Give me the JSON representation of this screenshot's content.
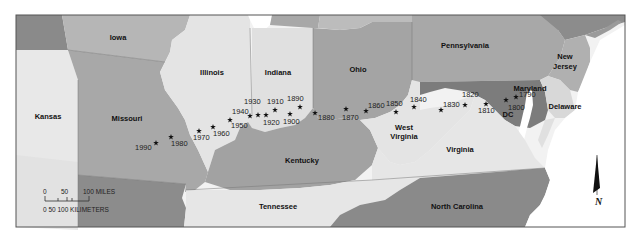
{
  "map": {
    "title": "Mean center of U.S. population, 1790–1990",
    "frame": {
      "x": 16,
      "y": 15,
      "w": 609,
      "h": 212
    },
    "colors": {
      "frame": "#555555",
      "water": "#ffffff",
      "light": "#e6e6e6",
      "mid": "#b4b4b4",
      "dark": "#8c8c8c",
      "darker": "#6e6e6e",
      "maryland": "#7a7a7a"
    },
    "states": [
      {
        "name": "Iowa",
        "label_x": 118,
        "label_y": 40
      },
      {
        "name": "Illinois",
        "label_x": 212,
        "label_y": 75
      },
      {
        "name": "Indiana",
        "label_x": 278,
        "label_y": 75
      },
      {
        "name": "Ohio",
        "label_x": 358,
        "label_y": 72
      },
      {
        "name": "Pennsylvania",
        "label_x": 465,
        "label_y": 48
      },
      {
        "name": "New",
        "label_x": 565,
        "label_y": 59
      },
      {
        "name": "Jersey",
        "label_x": 565,
        "label_y": 69
      },
      {
        "name": "Kansas",
        "label_x": 48,
        "label_y": 119
      },
      {
        "name": "Missouri",
        "label_x": 127,
        "label_y": 121
      },
      {
        "name": "Maryland",
        "label_x": 530,
        "label_y": 91
      },
      {
        "name": "Delaware",
        "label_x": 565,
        "label_y": 109
      },
      {
        "name": "DC",
        "label_x": 508,
        "label_y": 117
      },
      {
        "name": "West",
        "label_x": 404,
        "label_y": 130
      },
      {
        "name": "Virginia",
        "label_x": 404,
        "label_y": 139
      },
      {
        "name": "Virginia",
        "label_x": 460,
        "label_y": 152
      },
      {
        "name": "Kentucky",
        "label_x": 302,
        "label_y": 163
      },
      {
        "name": "Tennessee",
        "label_x": 278,
        "label_y": 209
      },
      {
        "name": "North Carolina",
        "label_x": 457,
        "label_y": 209
      }
    ],
    "population_centers": [
      {
        "year": "1790",
        "x": 516,
        "y": 97,
        "lx": 519,
        "ly": 97
      },
      {
        "year": "1800",
        "x": 506,
        "y": 100,
        "lx": 508,
        "ly": 110
      },
      {
        "year": "1810",
        "x": 486,
        "y": 104,
        "lx": 478,
        "ly": 113
      },
      {
        "year": "1820",
        "x": 465,
        "y": 105,
        "lx": 462,
        "ly": 97
      },
      {
        "year": "1830",
        "x": 441,
        "y": 110,
        "lx": 443,
        "ly": 107
      },
      {
        "year": "1840",
        "x": 414,
        "y": 107,
        "lx": 410,
        "ly": 102
      },
      {
        "year": "1850",
        "x": 396,
        "y": 112,
        "lx": 386,
        "ly": 106
      },
      {
        "year": "1860",
        "x": 366,
        "y": 111,
        "lx": 368,
        "ly": 108
      },
      {
        "year": "1870",
        "x": 346,
        "y": 109,
        "lx": 342,
        "ly": 120
      },
      {
        "year": "1880",
        "x": 315,
        "y": 113,
        "lx": 318,
        "ly": 120
      },
      {
        "year": "1890",
        "x": 300,
        "y": 107,
        "lx": 287,
        "ly": 101
      },
      {
        "year": "1900",
        "x": 290,
        "y": 114,
        "lx": 283,
        "ly": 124
      },
      {
        "year": "1910",
        "x": 275,
        "y": 110,
        "lx": 267,
        "ly": 104
      },
      {
        "year": "1920",
        "x": 266,
        "y": 115,
        "lx": 263,
        "ly": 125
      },
      {
        "year": "1930",
        "x": 258,
        "y": 115,
        "lx": 244,
        "ly": 104
      },
      {
        "year": "1940",
        "x": 250,
        "y": 116,
        "lx": 232,
        "ly": 114
      },
      {
        "year": "1950",
        "x": 230,
        "y": 120,
        "lx": 231,
        "ly": 128
      },
      {
        "year": "1960",
        "x": 213,
        "y": 127,
        "lx": 213,
        "ly": 136
      },
      {
        "year": "1970",
        "x": 199,
        "y": 131,
        "lx": 193,
        "ly": 140
      },
      {
        "year": "1980",
        "x": 171,
        "y": 137,
        "lx": 171,
        "ly": 146
      },
      {
        "year": "1990",
        "x": 156,
        "y": 143,
        "lx": 135,
        "ly": 150
      }
    ],
    "scale": {
      "miles_label": "100 MILES",
      "miles_ticks": [
        "0",
        "50"
      ],
      "km_label": "0  50 100 KILIMETERS"
    },
    "north_arrow": {
      "label": "N"
    }
  }
}
